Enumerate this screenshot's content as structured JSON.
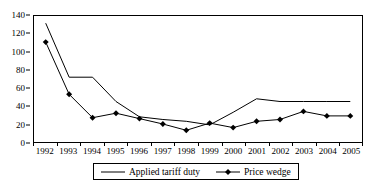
{
  "chart_data": {
    "type": "line",
    "title": "",
    "subtitle": "",
    "xlabel": "",
    "ylabel": "",
    "categories": [
      "1992",
      "1993",
      "1994",
      "1995",
      "1996",
      "1997",
      "1998",
      "1999",
      "2000",
      "2001",
      "2002",
      "2003",
      "2004",
      "2005"
    ],
    "series": [
      {
        "name": "Applied tariff duty",
        "marker": "none",
        "color": "#000000",
        "values": [
          132,
          72,
          72,
          45,
          28,
          25,
          23,
          19,
          33,
          48,
          45,
          45,
          45,
          45
        ]
      },
      {
        "name": "Price wedge",
        "marker": "diamond",
        "color": "#000000",
        "values": [
          111,
          53,
          27,
          32,
          26,
          20,
          13,
          21,
          16,
          23,
          25,
          34,
          29,
          29
        ]
      }
    ],
    "ylim": [
      0,
      140
    ],
    "ytick_step": 20,
    "yticks": [
      "0",
      "20",
      "40",
      "60",
      "80",
      "100",
      "120",
      "140"
    ],
    "grid": false,
    "legend_position": "bottom"
  },
  "legend": {
    "entries": [
      {
        "label": "Applied tariff duty",
        "marker": "line"
      },
      {
        "label": "Price wedge",
        "marker": "line-diamond"
      }
    ]
  },
  "axes": {
    "y_axis_name": "value-axis",
    "x_axis_name": "year-axis"
  }
}
